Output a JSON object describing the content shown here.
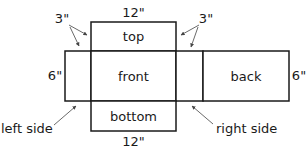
{
  "diagram": {
    "type": "box-net",
    "panels": {
      "top": "top",
      "front": "front",
      "back": "back",
      "bottom": "bottom"
    },
    "callouts": {
      "left_side": "left side",
      "right_side": "right side"
    },
    "dimensions": {
      "top_width": "12\"",
      "bottom_width": "12\"",
      "left_height": "6\"",
      "right_height": "6\"",
      "left_flap": "3\"",
      "right_flap": "3\""
    },
    "colors": {
      "line": "#1a1a1a",
      "background": "#ffffff"
    }
  }
}
